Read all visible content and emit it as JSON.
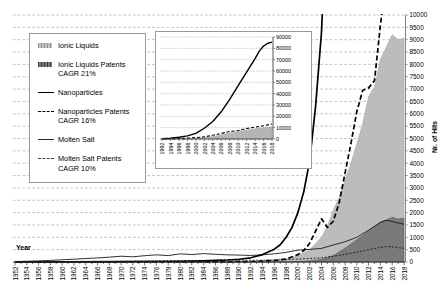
{
  "axes": {
    "x_title": "Year",
    "y_title": "Nr. of Hits"
  },
  "legend": {
    "items": [
      {
        "label": "Ionic Liquids",
        "sublabel": "",
        "swatch": "area-light"
      },
      {
        "label": "Ionic Liquids Patents",
        "sublabel": "CAGR 21%",
        "swatch": "area-dark"
      },
      {
        "label": "Nanoparticles",
        "sublabel": "",
        "swatch": "line-thick"
      },
      {
        "label": "Nanoparticles Patents",
        "sublabel": "CAGR 16%",
        "swatch": "line-thick-dash"
      },
      {
        "label": "Molten Salt",
        "sublabel": "",
        "swatch": "line-thin"
      },
      {
        "label": "Molten Salt Patents",
        "sublabel": "CAGR 10%",
        "swatch": "line-thin-dash"
      }
    ]
  },
  "colors": {
    "ionic_area": "#bcbcbc",
    "ionic_area_edge": "#9a9a9a",
    "ionic_patents_area": "#7a7a7a",
    "ionic_patents_edge": "#4a4a4a",
    "line_black": "#000000",
    "line_thin": "#1a1a1a",
    "gridline": "#a6a6a6",
    "axis_line": "#333333",
    "right_axis_line": "#808080"
  },
  "chart_data": [
    {
      "id": "main",
      "type": "area",
      "title": "",
      "xlabel": "Year",
      "ylabel": "Nr. of Hits",
      "xlim": [
        1952,
        2018
      ],
      "ylim": [
        0,
        10000
      ],
      "grid": "dashed horizontal every 500",
      "legend_position": "upper left box",
      "x_tick_labels": [
        "1952",
        "1954",
        "1956",
        "1958",
        "1960",
        "1962",
        "1964",
        "1966",
        "1968",
        "1970",
        "1972",
        "1974",
        "1976",
        "1978",
        "1980",
        "1982",
        "1984",
        "1986",
        "1988",
        "1990",
        "1992",
        "1994",
        "1996",
        "1998",
        "2000",
        "2002",
        "2004",
        "2006",
        "2008",
        "2010",
        "2012",
        "2014",
        "2016",
        "2018"
      ],
      "y_tick_labels": [
        "0",
        "500",
        "1000",
        "1500",
        "2000",
        "2500",
        "3000",
        "3500",
        "4000",
        "4500",
        "5000",
        "5500",
        "6000",
        "6500",
        "7000",
        "7500",
        "8000",
        "8500",
        "9000",
        "9500",
        "10000"
      ],
      "series": [
        {
          "name": "Ionic Liquids",
          "kind": "area",
          "color": "#bcbcbc",
          "edge": "#9a9a9a",
          "points": [
            [
              1952,
              0
            ],
            [
              1970,
              0
            ],
            [
              1988,
              5
            ],
            [
              1990,
              10
            ],
            [
              1992,
              20
            ],
            [
              1994,
              35
            ],
            [
              1996,
              60
            ],
            [
              1998,
              120
            ],
            [
              2000,
              250
            ],
            [
              2002,
              500
            ],
            [
              2004,
              1000
            ],
            [
              2005,
              1450
            ],
            [
              2006,
              2100
            ],
            [
              2007,
              2600
            ],
            [
              2008,
              3300
            ],
            [
              2009,
              4000
            ],
            [
              2010,
              4800
            ],
            [
              2011,
              5600
            ],
            [
              2012,
              6700
            ],
            [
              2013,
              7100
            ],
            [
              2014,
              8200
            ],
            [
              2015,
              8700
            ],
            [
              2016,
              9200
            ],
            [
              2017,
              9000
            ],
            [
              2018,
              9060
            ]
          ]
        },
        {
          "name": "Ionic Liquids Patents",
          "kind": "area",
          "cagr": "21%",
          "color": "#7a7a7a",
          "edge": "#4a4a4a",
          "points": [
            [
              1952,
              0
            ],
            [
              1998,
              0
            ],
            [
              2000,
              20
            ],
            [
              2002,
              45
            ],
            [
              2004,
              110
            ],
            [
              2006,
              260
            ],
            [
              2008,
              560
            ],
            [
              2010,
              900
            ],
            [
              2012,
              1260
            ],
            [
              2014,
              1620
            ],
            [
              2015,
              1700
            ],
            [
              2016,
              1810
            ],
            [
              2017,
              1740
            ],
            [
              2018,
              1780
            ]
          ]
        },
        {
          "name": "Molten Salt",
          "kind": "line",
          "color": "#1a1a1a",
          "width": 0.9,
          "dash": "",
          "points": [
            [
              1952,
              20
            ],
            [
              1954,
              30
            ],
            [
              1956,
              45
            ],
            [
              1958,
              65
            ],
            [
              1960,
              90
            ],
            [
              1962,
              115
            ],
            [
              1964,
              140
            ],
            [
              1966,
              165
            ],
            [
              1968,
              195
            ],
            [
              1970,
              235
            ],
            [
              1972,
              210
            ],
            [
              1974,
              255
            ],
            [
              1976,
              290
            ],
            [
              1978,
              260
            ],
            [
              1980,
              330
            ],
            [
              1982,
              300
            ],
            [
              1984,
              340
            ],
            [
              1986,
              310
            ],
            [
              1988,
              290
            ],
            [
              1990,
              280
            ],
            [
              1992,
              265
            ],
            [
              1994,
              290
            ],
            [
              1996,
              330
            ],
            [
              1998,
              390
            ],
            [
              2000,
              480
            ],
            [
              2002,
              510
            ],
            [
              2004,
              550
            ],
            [
              2006,
              690
            ],
            [
              2008,
              820
            ],
            [
              2010,
              1000
            ],
            [
              2012,
              1290
            ],
            [
              2014,
              1600
            ],
            [
              2015,
              1690
            ],
            [
              2016,
              1640
            ],
            [
              2017,
              1580
            ],
            [
              2018,
              1530
            ]
          ]
        },
        {
          "name": "Molten Salt Patents",
          "kind": "line",
          "cagr": "10%",
          "color": "#1a1a1a",
          "width": 0.9,
          "dash": "2 1.6",
          "points": [
            [
              1952,
              2
            ],
            [
              1956,
              5
            ],
            [
              1960,
              8
            ],
            [
              1964,
              14
            ],
            [
              1968,
              20
            ],
            [
              1972,
              30
            ],
            [
              1976,
              40
            ],
            [
              1980,
              55
            ],
            [
              1984,
              60
            ],
            [
              1986,
              75
            ],
            [
              1988,
              95
            ],
            [
              1990,
              70
            ],
            [
              1992,
              70
            ],
            [
              1994,
              75
            ],
            [
              1996,
              85
            ],
            [
              1998,
              95
            ],
            [
              2000,
              120
            ],
            [
              2002,
              140
            ],
            [
              2004,
              170
            ],
            [
              2006,
              230
            ],
            [
              2008,
              310
            ],
            [
              2010,
              400
            ],
            [
              2012,
              500
            ],
            [
              2014,
              590
            ],
            [
              2015,
              630
            ],
            [
              2016,
              610
            ],
            [
              2017,
              580
            ],
            [
              2018,
              550
            ]
          ]
        },
        {
          "name": "Nanoparticles",
          "kind": "line",
          "color": "#000000",
          "width": 1.7,
          "dash": "",
          "points": [
            [
              1952,
              2
            ],
            [
              1960,
              5
            ],
            [
              1970,
              12
            ],
            [
              1980,
              30
            ],
            [
              1984,
              45
            ],
            [
              1988,
              80
            ],
            [
              1990,
              110
            ],
            [
              1992,
              170
            ],
            [
              1994,
              300
            ],
            [
              1996,
              520
            ],
            [
              1997,
              700
            ],
            [
              1998,
              1000
            ],
            [
              1999,
              1400
            ],
            [
              2000,
              2000
            ],
            [
              2001,
              2850
            ],
            [
              2002,
              4100
            ],
            [
              2003,
              6300
            ],
            [
              2004,
              9300
            ],
            [
              2005,
              14500
            ]
          ]
        },
        {
          "name": "Nanoparticles Patents",
          "kind": "line",
          "cagr": "16%",
          "color": "#000000",
          "width": 1.7,
          "dash": "5 2.6",
          "points": [
            [
              1952,
              0
            ],
            [
              1988,
              5
            ],
            [
              1992,
              20
            ],
            [
              1994,
              35
            ],
            [
              1996,
              60
            ],
            [
              1998,
              120
            ],
            [
              2000,
              300
            ],
            [
              2001,
              460
            ],
            [
              2002,
              760
            ],
            [
              2003,
              1250
            ],
            [
              2004,
              1750
            ],
            [
              2005,
              1400
            ],
            [
              2006,
              1650
            ],
            [
              2007,
              2400
            ],
            [
              2008,
              3600
            ],
            [
              2009,
              4800
            ],
            [
              2010,
              6100
            ],
            [
              2011,
              6950
            ],
            [
              2012,
              7050
            ],
            [
              2013,
              7350
            ],
            [
              2014,
              9600
            ],
            [
              2015,
              11500
            ]
          ]
        }
      ]
    },
    {
      "id": "inset",
      "type": "area",
      "title": "",
      "xlabel": "",
      "ylabel": "",
      "xlim": [
        1992,
        2018
      ],
      "ylim": [
        0,
        90000
      ],
      "grid": "dotted horizontal every 10000",
      "x_tick_labels": [
        "1992",
        "1994",
        "1996",
        "1998",
        "2000",
        "2002",
        "2004",
        "2006",
        "2008",
        "2010",
        "2012",
        "2014",
        "2016",
        "2018"
      ],
      "y_tick_labels": [
        "0",
        "10000",
        "20000",
        "30000",
        "40000",
        "50000",
        "60000",
        "70000",
        "80000",
        "90000"
      ],
      "series": [
        {
          "name": "Ionic Liquids",
          "kind": "area",
          "color": "#b5b5b5",
          "edge": "#999999",
          "points": [
            [
              1992,
              0
            ],
            [
              1994,
              60
            ],
            [
              1996,
              160
            ],
            [
              1998,
              320
            ],
            [
              2000,
              620
            ],
            [
              2002,
              1250
            ],
            [
              2004,
              2300
            ],
            [
              2006,
              3600
            ],
            [
              2008,
              5300
            ],
            [
              2010,
              6700
            ],
            [
              2012,
              8000
            ],
            [
              2014,
              9100
            ],
            [
              2016,
              10100
            ],
            [
              2018,
              10800
            ]
          ]
        },
        {
          "name": "Nanoparticles Patents",
          "kind": "line",
          "color": "#000000",
          "width": 1.1,
          "dash": "3.2 1.8",
          "points": [
            [
              1992,
              100
            ],
            [
              1994,
              250
            ],
            [
              1996,
              450
            ],
            [
              1998,
              750
            ],
            [
              2000,
              1200
            ],
            [
              2002,
              1900
            ],
            [
              2004,
              3300
            ],
            [
              2006,
              4900
            ],
            [
              2008,
              6600
            ],
            [
              2010,
              7500
            ],
            [
              2012,
              9200
            ],
            [
              2014,
              10500
            ],
            [
              2016,
              11700
            ],
            [
              2018,
              13200
            ]
          ]
        },
        {
          "name": "Nanoparticles",
          "kind": "line",
          "color": "#000000",
          "width": 1.4,
          "dash": "",
          "points": [
            [
              1992,
              300
            ],
            [
              1994,
              700
            ],
            [
              1996,
              1500
            ],
            [
              1998,
              2800
            ],
            [
              2000,
              5000
            ],
            [
              2002,
              9500
            ],
            [
              2004,
              15500
            ],
            [
              2006,
              24000
            ],
            [
              2008,
              35000
            ],
            [
              2010,
              47000
            ],
            [
              2012,
              59000
            ],
            [
              2014,
              71000
            ],
            [
              2015,
              77500
            ],
            [
              2016,
              82000
            ],
            [
              2017,
              84500
            ],
            [
              2018,
              85500
            ]
          ]
        }
      ]
    }
  ]
}
